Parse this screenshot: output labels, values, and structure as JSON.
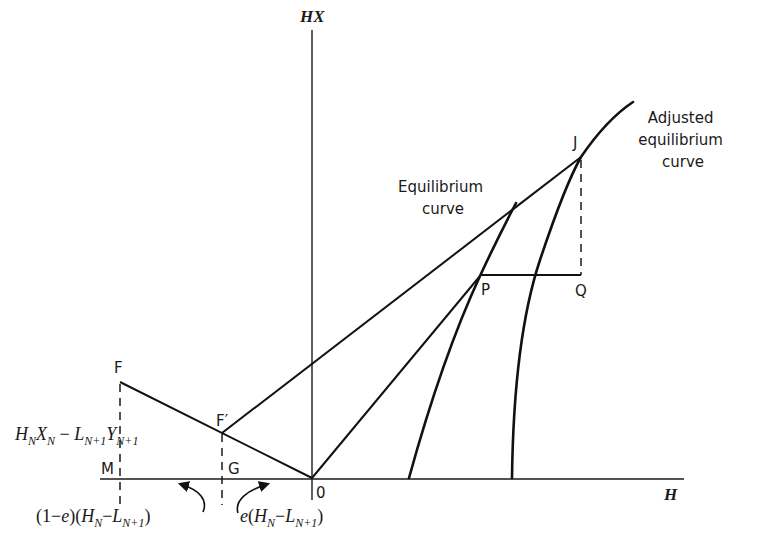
{
  "axes": {
    "y_label": "HX",
    "x_label": "H",
    "origin_label": "0"
  },
  "points": {
    "F": "F",
    "F_prime": "F′",
    "M": "M",
    "G": "G",
    "P": "P",
    "Q": "Q",
    "J": "J"
  },
  "curves": {
    "equilibrium": {
      "line1": "Equilibrium",
      "line2": "curve"
    },
    "adjusted": {
      "line1": "Adjusted",
      "line2": "equilibrium",
      "line3": "curve"
    }
  },
  "annotations": {
    "difference_point": {
      "H": "H",
      "N": "N",
      "X": "X",
      "N2": "N",
      "minus": " − ",
      "L": "L",
      "Np1": "N+1",
      "Y": "Y",
      "Np1b": "N+1"
    },
    "left_segment": {
      "prefix": "(1−",
      "e": "e",
      "mid": ")(",
      "H": "H",
      "N": "N",
      "minus": "−",
      "L": "L",
      "Np1": "N+1",
      "suffix": ")"
    },
    "right_segment": {
      "e": "e",
      "open": "(",
      "H": "H",
      "N": "N",
      "minus": "−",
      "L": "L",
      "Np1": "N+1",
      "suffix": ")"
    }
  },
  "colors": {
    "ink": "#111111",
    "background": "#ffffff"
  }
}
